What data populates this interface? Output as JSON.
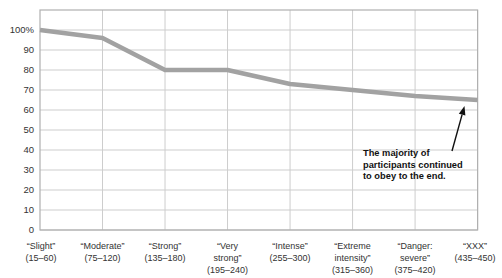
{
  "chart_data": {
    "type": "line",
    "title": "",
    "xlabel": "",
    "ylabel": "",
    "ylim": [
      0,
      110
    ],
    "grid": true,
    "legend": "none",
    "categories": [
      "“Slight” (15–60)",
      "“Moderate” (75–120)",
      "“Strong” (135–180)",
      "“Very strong” (195–240)",
      "“Intense” (255–300)",
      "“Extreme intensity” (315–360)",
      "“Danger: severe” (375–420)",
      "“XXX” (435–450)"
    ],
    "category_label_lines": [
      [
        "“Slight”",
        "(15–60)"
      ],
      [
        "“Moderate”",
        "(75–120)"
      ],
      [
        "“Strong”",
        "(135–180)"
      ],
      [
        "“Very",
        "strong”",
        "(195–240)"
      ],
      [
        "“Intense”",
        "(255–300)"
      ],
      [
        "“Extreme",
        "intensity”",
        "(315–360)"
      ],
      [
        "“Danger:",
        "severe”",
        "(375–420)"
      ],
      [
        "“XXX”",
        "(435–450)"
      ]
    ],
    "values": [
      100,
      96,
      80,
      80,
      73,
      70,
      67,
      65
    ],
    "y_ticks": {
      "values": [
        100,
        90,
        80,
        70,
        60,
        50,
        40,
        30,
        20,
        10,
        0
      ],
      "labels": [
        "100%",
        "90",
        "80",
        "70",
        "60",
        "50",
        "40",
        "30",
        "20",
        "10",
        "0"
      ]
    },
    "annotation": {
      "text": "The majority of participants continued to obey to the end.",
      "lines": [
        "The majority of",
        "participants continued",
        "to obey to the end."
      ]
    },
    "colors": {
      "line": "#a2a2a2",
      "grid": "#cdcdcd",
      "frame": "#b0b0b0",
      "tick_text": "#333333",
      "annotation_text": "#111111",
      "arrow": "#111111",
      "background": "#ffffff"
    }
  }
}
